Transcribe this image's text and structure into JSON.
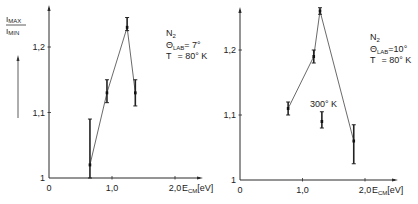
{
  "figure": {
    "ylabel_numerator": "I",
    "ylabel_numerator_sub": "MAX",
    "ylabel_denominator": "I",
    "ylabel_denominator_sub": "MIN"
  },
  "chart_data": [
    {
      "type": "line",
      "title": "",
      "xlabel": "E_CM [eV]",
      "xlabel_main": "E",
      "xlabel_sub": "CM",
      "xlabel_unit": "[eV]",
      "ylabel": "I_MAX / I_MIN",
      "xlim": [
        0,
        2.3
      ],
      "ylim": [
        1.0,
        1.26
      ],
      "x_ticks": [
        0,
        1.0,
        2.0
      ],
      "x_tick_labels": [
        "0",
        "1,0",
        "2,0"
      ],
      "y_ticks": [
        1.0,
        1.1,
        1.2
      ],
      "y_tick_labels": [
        "1",
        "1,1",
        "1,2"
      ],
      "grid": false,
      "annotation": {
        "species": "N",
        "species_sub": "2",
        "theta_label": "Θ",
        "theta_sub": "LAB",
        "theta_value": "= 7°",
        "temp_label": "T",
        "temp_value": "= 80° K"
      },
      "series": [
        {
          "name": "T = 80 K",
          "x": [
            0.65,
            0.92,
            1.24,
            1.37
          ],
          "y": [
            1.02,
            1.13,
            1.23,
            1.13
          ],
          "err_low": [
            1.0,
            1.115,
            1.225,
            1.11
          ],
          "err_high": [
            1.09,
            1.15,
            1.245,
            1.15
          ]
        }
      ]
    },
    {
      "type": "line",
      "title": "",
      "xlabel": "E_CM [eV]",
      "xlabel_main": "E",
      "xlabel_sub": "CM",
      "xlabel_unit": "[eV]",
      "ylabel": "I_MAX / I_MIN",
      "xlim": [
        0,
        2.3
      ],
      "ylim": [
        1.0,
        1.27
      ],
      "x_ticks": [
        0,
        1.0,
        2.0
      ],
      "x_tick_labels": [
        "0",
        "1,0",
        "2,0"
      ],
      "y_ticks": [
        1.0,
        1.1,
        1.2
      ],
      "y_tick_labels": [
        "1",
        "1,1",
        "1,2"
      ],
      "grid": false,
      "annotation": {
        "species": "N",
        "species_sub": "2",
        "theta_label": "Θ",
        "theta_sub": "LAB",
        "theta_value": "=10°",
        "temp_label": "T",
        "temp_value": "= 80° K"
      },
      "series": [
        {
          "name": "T = 80 K",
          "x": [
            0.77,
            1.18,
            1.28,
            1.82
          ],
          "y": [
            1.11,
            1.19,
            1.26,
            1.06
          ],
          "err_low": [
            1.1,
            1.18,
            1.255,
            1.025
          ],
          "err_high": [
            1.12,
            1.2,
            1.265,
            1.085
          ]
        },
        {
          "name": "300 K",
          "label": "300° K",
          "x": [
            1.31
          ],
          "y": [
            1.09
          ],
          "err_low": [
            1.08
          ],
          "err_high": [
            1.105
          ]
        }
      ]
    }
  ]
}
